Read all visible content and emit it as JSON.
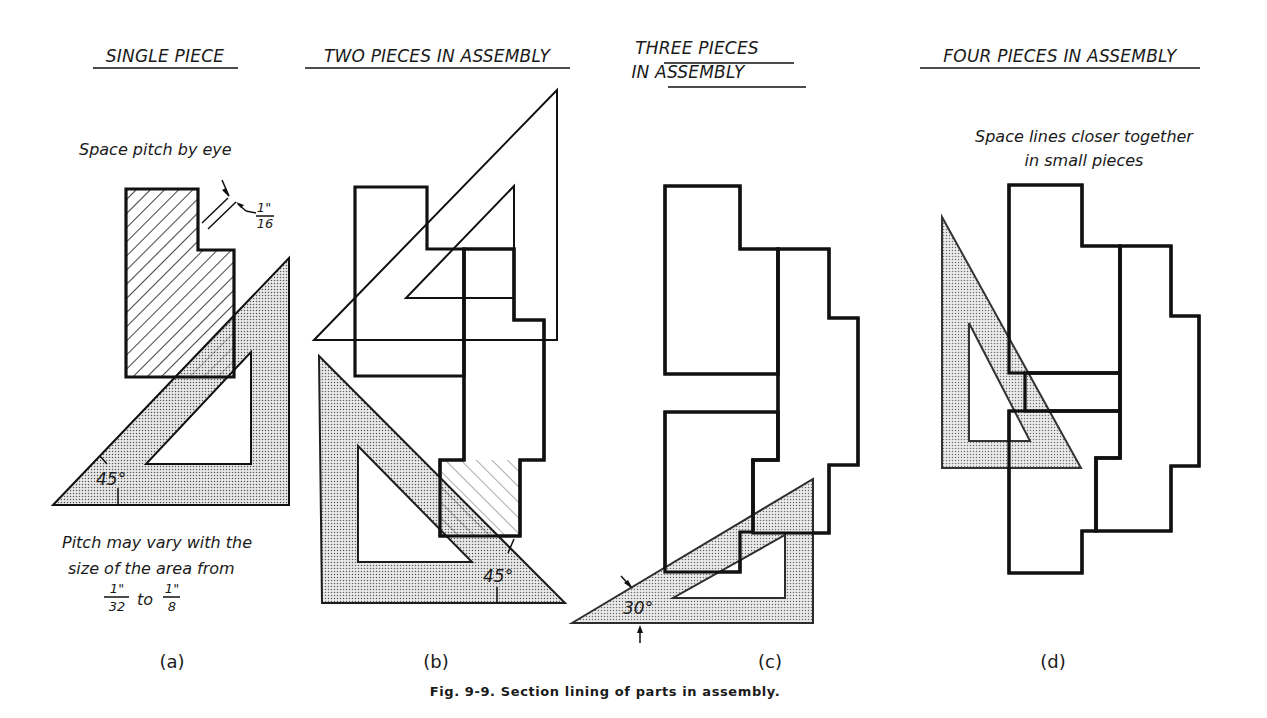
{
  "figure": {
    "caption": "Fig. 9-9. Section lining of parts in assembly.",
    "colors": {
      "ink": "#111111",
      "paper": "#ffffff",
      "stipple": "#8a8a8a"
    }
  },
  "panels": [
    {
      "id": "a",
      "label": "(a)",
      "title_lines": [
        "SINGLE PIECE"
      ],
      "notes": {
        "pitch_callout": "Space pitch by eye",
        "pitch_value_num": "1\"",
        "pitch_value_den": "16",
        "angle": "45°",
        "footnote_lines": [
          "Pitch may vary with the",
          "size of the area from"
        ],
        "range_from_num": "1\"",
        "range_from_den": "32",
        "range_to_word": "to",
        "range_to_num": "1\"",
        "range_to_den": "8"
      }
    },
    {
      "id": "b",
      "label": "(b)",
      "title_lines": [
        "TWO PIECES IN ASSEMBLY"
      ],
      "notes": {
        "angle": "45°"
      }
    },
    {
      "id": "c",
      "label": "(c)",
      "title_lines": [
        "THREE PIECES",
        "IN ASSEMBLY"
      ],
      "notes": {
        "angle": "30°"
      }
    },
    {
      "id": "d",
      "label": "(d)",
      "title_lines": [
        "FOUR PIECES IN ASSEMBLY"
      ],
      "notes": {
        "callout_lines": [
          "Space lines closer together",
          "in small pieces"
        ]
      }
    }
  ]
}
